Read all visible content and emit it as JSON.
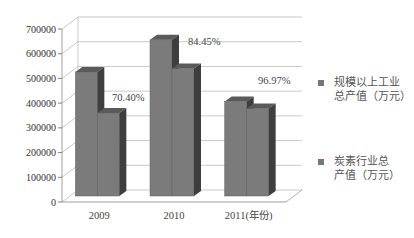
{
  "chart_data": {
    "type": "bar",
    "style": "3d-clustered-column",
    "title": "",
    "xlabel": "",
    "ylabel": "",
    "categories": [
      "2009",
      "2010",
      "2011(年份)"
    ],
    "series": [
      {
        "name": "规模以上工业总产值（万元）",
        "values": [
          510000,
          640000,
          390000
        ],
        "color": "#7a7a7a"
      },
      {
        "name": "炭素行业总产值（万元）",
        "values": [
          360000,
          540000,
          378000
        ],
        "color": "#6e6e6e"
      }
    ],
    "annotations": [
      "70.40%",
      "84.45%",
      "96.97%"
    ],
    "yticks": [
      "0",
      "100000",
      "200000",
      "300000",
      "400000",
      "500000",
      "600000",
      "700000"
    ],
    "ylim": [
      0,
      700000
    ],
    "grid": true,
    "legend_position": "right"
  },
  "legend": {
    "item1_line1": "规模以上工业",
    "item1_line2": "总产值（万元）",
    "item2_line1": "炭素行业总",
    "item2_line2": "产值（万元）"
  }
}
